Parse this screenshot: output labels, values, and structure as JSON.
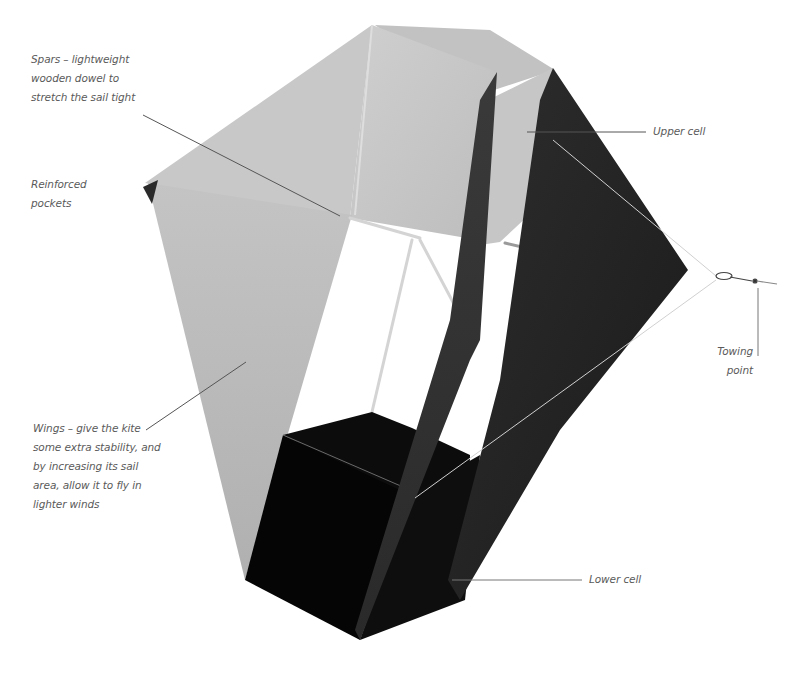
{
  "diagram": {
    "colors": {
      "background": "#ffffff",
      "sail_light": "#c9c9c9",
      "sail_mid": "#b3b3b3",
      "sail_dark": "#2a2a2a",
      "sail_darkest": "#0a0a0a",
      "spar": "#d8d8d8",
      "leader_line": "#555555",
      "label_text": "#5a5a5a"
    },
    "labels": {
      "spars": {
        "lines": [
          "Spars – lightweight",
          "wooden dowel to",
          "stretch the sail tight"
        ]
      },
      "reinforced_pockets": {
        "lines": [
          "Reinforced",
          "pockets"
        ]
      },
      "wings": {
        "lines": [
          "Wings – give the kite",
          "some extra stability, and",
          "by increasing its sail",
          "area, allow it to fly in",
          "lighter winds"
        ]
      },
      "upper_cell": {
        "lines": [
          "Upper cell"
        ]
      },
      "towing_point": {
        "lines": [
          "Towing",
          "point"
        ]
      },
      "lower_cell": {
        "lines": [
          "Lower cell"
        ]
      }
    }
  }
}
